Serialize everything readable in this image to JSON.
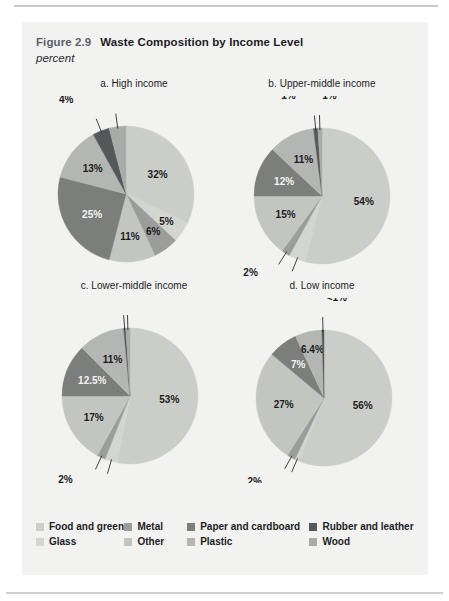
{
  "figure": {
    "number": "Figure 2.9",
    "title": "Waste Composition by Income Level",
    "subtitle": "percent"
  },
  "colors": {
    "food_and_green": "#cbcdc8",
    "glass": "#d3d5d1",
    "metal": "#9a9d99",
    "other": "#c3c5c1",
    "paper_and_cardboard": "#7b7e7b",
    "plastic": "#b3b6b2",
    "rubber_and_leather": "#55585a",
    "wood": "#a8aba7",
    "panel_background": "#f2f2f1",
    "label_dark": "#1b1c1e",
    "label_light": "#f4f4f3"
  },
  "legend": {
    "rows": [
      [
        {
          "label": "Food and green",
          "color_key": "food_and_green",
          "name": "food-and-green"
        },
        {
          "label": "Metal",
          "color_key": "metal",
          "name": "metal"
        },
        {
          "label": "Paper and cardboard",
          "color_key": "paper_and_cardboard",
          "name": "paper-and-cardboard"
        },
        {
          "label": "Rubber and leather",
          "color_key": "rubber_and_leather",
          "name": "rubber-and-leather"
        }
      ],
      [
        {
          "label": "Glass",
          "color_key": "glass",
          "name": "glass"
        },
        {
          "label": "Other",
          "color_key": "other",
          "name": "other"
        },
        {
          "label": "Plastic",
          "color_key": "plastic",
          "name": "plastic"
        },
        {
          "label": "Wood",
          "color_key": "wood",
          "name": "wood"
        }
      ]
    ]
  },
  "chart_data": [
    {
      "type": "pie",
      "id": "a",
      "title": "a. High income",
      "unit": "percent",
      "categories": [
        "Food and green",
        "Glass",
        "Metal",
        "Other",
        "Paper and cardboard",
        "Plastic",
        "Rubber and leather",
        "Wood"
      ],
      "values": [
        32,
        5,
        6,
        11,
        25,
        13,
        4,
        4
      ],
      "labels": [
        "32%",
        "5%",
        "6%",
        "11%",
        "25%",
        "13%",
        "4%",
        "4%"
      ]
    },
    {
      "type": "pie",
      "id": "b",
      "title": "b. Upper-middle income",
      "unit": "percent",
      "categories": [
        "Food and green",
        "Glass",
        "Metal",
        "Other",
        "Paper and cardboard",
        "Plastic",
        "Rubber and leather",
        "Wood"
      ],
      "values": [
        54,
        4,
        2,
        15,
        12,
        11,
        1,
        1
      ],
      "labels": [
        "54%",
        "4%",
        "2%",
        "15%",
        "12%",
        "11%",
        "1%",
        "1%"
      ]
    },
    {
      "type": "pie",
      "id": "c",
      "title": "c. Lower-middle income",
      "unit": "percent",
      "categories": [
        "Food and green",
        "Glass",
        "Metal",
        "Other",
        "Paper and cardboard",
        "Plastic",
        "Rubber and leather",
        "Wood"
      ],
      "values": [
        53,
        3,
        2,
        17,
        12.5,
        11,
        0.5,
        1
      ],
      "labels": [
        "53%",
        "3%",
        "2%",
        "17%",
        "12.5%",
        "11%",
        "<1%",
        "1%"
      ]
    },
    {
      "type": "pie",
      "id": "d",
      "title": "d. Low income",
      "unit": "percent",
      "categories": [
        "Food and green",
        "Glass",
        "Metal",
        "Other",
        "Paper and cardboard",
        "Plastic",
        "Rubber and leather",
        "Wood"
      ],
      "values": [
        56,
        1,
        2,
        27,
        7,
        6.4,
        0.5,
        0
      ],
      "labels": [
        "56%",
        "1%",
        "2%",
        "27%",
        "7%",
        "6.4%",
        "<1%",
        ""
      ]
    }
  ]
}
